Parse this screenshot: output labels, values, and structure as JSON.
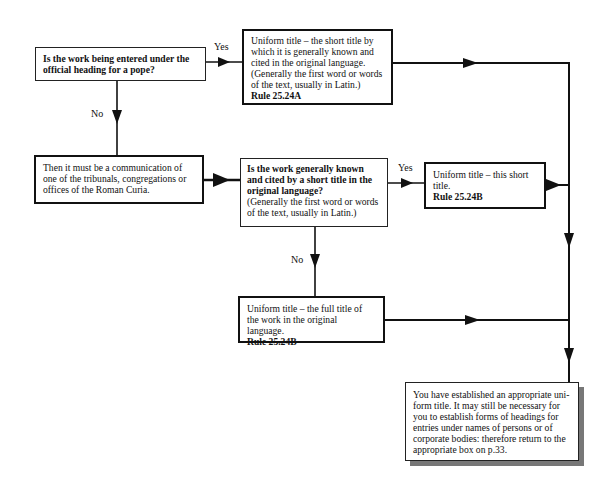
{
  "nodes": {
    "q_pope": {
      "text": "Is the work being entered under the official heading for a pope?"
    },
    "uniform_short_a": {
      "line1": "Uniform title – the short title by which it is generally known and cited in the original language.",
      "line2": "(Generally the first word or words of the text, usually in Latin.)",
      "rule": "Rule 25.24A"
    },
    "roman_curia": {
      "text": "Then it must be a communication of one of the tribunals, congregations or offices of the Roman Curia."
    },
    "q_short_title": {
      "question": "Is the work generally known and cited by a short title in the original language?",
      "note": "(Generally the first word or words of the text, usually in Latin.)"
    },
    "uniform_short_b": {
      "text": "Uniform title – this short title.",
      "rule": "Rule 25.24B"
    },
    "uniform_full_b": {
      "text": "Uniform title – the full title of the work in the original language.",
      "rule": "Rule 25.24B"
    },
    "final": {
      "text": "You have established an appropriate uni-form title. It may still be necessary for you to establish forms of headings for entries under names of persons or of corporate bodies: therefore return to the appropriate box on p.33."
    }
  },
  "edges": {
    "pope_yes": "Yes",
    "pope_no": "No",
    "short_yes": "Yes",
    "short_no": "No"
  }
}
